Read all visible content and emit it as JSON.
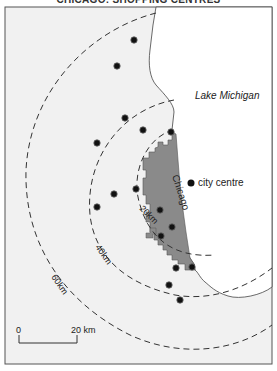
{
  "title": "CHICAGO: SHOPPING CENTRES",
  "labels": {
    "lake": "Lake Michigan",
    "city": "Chicago",
    "city_centre": "city centre",
    "ring_20": "20km",
    "ring_40": "40km",
    "ring_60": "60km",
    "scale_zero": "0",
    "scale_end": "20 km"
  },
  "colors": {
    "land": "#f1f1f1",
    "water": "#ffffff",
    "city": "#8a8a8a",
    "dots": "#111111"
  },
  "shopping_centres": [
    {
      "x": 134,
      "y": 40
    },
    {
      "x": 117,
      "y": 66
    },
    {
      "x": 125,
      "y": 118
    },
    {
      "x": 143,
      "y": 130
    },
    {
      "x": 171,
      "y": 132
    },
    {
      "x": 97,
      "y": 143
    },
    {
      "x": 114,
      "y": 194
    },
    {
      "x": 136,
      "y": 189
    },
    {
      "x": 97,
      "y": 207
    },
    {
      "x": 160,
      "y": 210
    },
    {
      "x": 172,
      "y": 227
    },
    {
      "x": 161,
      "y": 236
    },
    {
      "x": 176,
      "y": 268
    },
    {
      "x": 192,
      "y": 267
    },
    {
      "x": 169,
      "y": 285
    },
    {
      "x": 180,
      "y": 300
    }
  ]
}
